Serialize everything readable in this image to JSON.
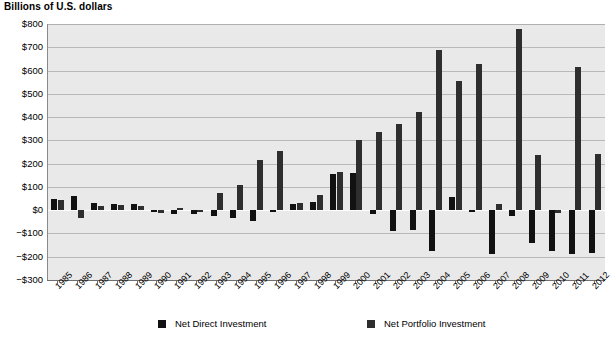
{
  "chart_data": {
    "type": "bar",
    "title": "Billions of U.S. dollars",
    "xlabel": "",
    "ylabel": "Billions of U.S. dollars",
    "ylim": [
      -300,
      800
    ],
    "ytick_step": 100,
    "grid": true,
    "legend_position": "bottom",
    "categories": [
      "1985",
      "1986",
      "1987",
      "1988",
      "1989",
      "1990",
      "1991",
      "1992",
      "1993",
      "1994",
      "1995",
      "1996",
      "1997",
      "1998",
      "1999",
      "2000",
      "2001",
      "2002",
      "2003",
      "2004",
      "2005",
      "2006",
      "2007",
      "2008",
      "2009",
      "2010",
      "2011",
      "2012"
    ],
    "series": [
      {
        "name": "Net Direct Investment",
        "color": "#111111",
        "values": [
          50,
          60,
          30,
          28,
          25,
          -10,
          -15,
          -15,
          -25,
          -35,
          -45,
          -10,
          25,
          35,
          155,
          160,
          -15,
          -90,
          -85,
          -175,
          55,
          -5,
          -190,
          -25,
          -140,
          -175,
          -190,
          -185
        ]
      },
      {
        "name": "Net Portfolio Investment",
        "color": "#2e2e2e",
        "values": [
          45,
          -35,
          20,
          22,
          18,
          -12,
          10,
          -5,
          75,
          110,
          215,
          255,
          30,
          65,
          165,
          300,
          335,
          370,
          420,
          690,
          555,
          630,
          25,
          780,
          235,
          -12,
          615,
          240
        ]
      }
    ],
    "ytick_labels": [
      "$800",
      "$700",
      "$600",
      "$500",
      "$400",
      "$300",
      "$200",
      "$100",
      "$0",
      "−$100",
      "−$200",
      "−$300"
    ],
    "ytick_values": [
      800,
      700,
      600,
      500,
      400,
      300,
      200,
      100,
      0,
      -100,
      -200,
      -300
    ]
  },
  "legend": {
    "items": [
      {
        "label": "Net Direct Investment",
        "key": "direct"
      },
      {
        "label": "Net Portfolio Investment",
        "key": "portfolio"
      }
    ]
  }
}
